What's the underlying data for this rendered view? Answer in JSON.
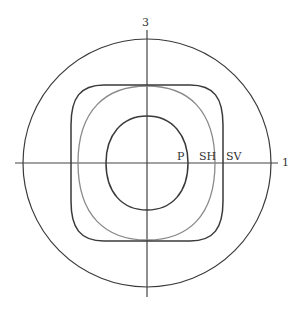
{
  "diagram": {
    "axes": {
      "horizontal_label": "1",
      "vertical_label": "3"
    },
    "curves": [
      {
        "name": "P",
        "label": "P",
        "color": "#3a3a3a"
      },
      {
        "name": "SH",
        "label": "SH",
        "color": "#8a8a8a"
      },
      {
        "name": "SV",
        "label": "SV",
        "color": "#3a3a3a"
      },
      {
        "name": "outer-circle",
        "label": "",
        "color": "#3a3a3a"
      }
    ]
  }
}
